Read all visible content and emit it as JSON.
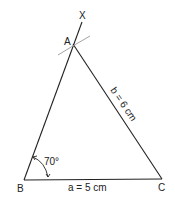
{
  "diagram": {
    "vertices": {
      "A": {
        "label": "A",
        "x": 73,
        "y": 44
      },
      "B": {
        "label": "B",
        "x": 24,
        "y": 180
      },
      "C": {
        "label": "C",
        "x": 162,
        "y": 179
      },
      "X": {
        "label": "X",
        "x": 83,
        "y": 13
      }
    },
    "sides": {
      "a": {
        "label": "a = 5 cm"
      },
      "b": {
        "label": "b = 6 cm"
      }
    },
    "angle_B": {
      "label": "70°"
    },
    "colors": {
      "line": "#222222",
      "construction_arc": "#999999",
      "background": "#ffffff"
    }
  }
}
